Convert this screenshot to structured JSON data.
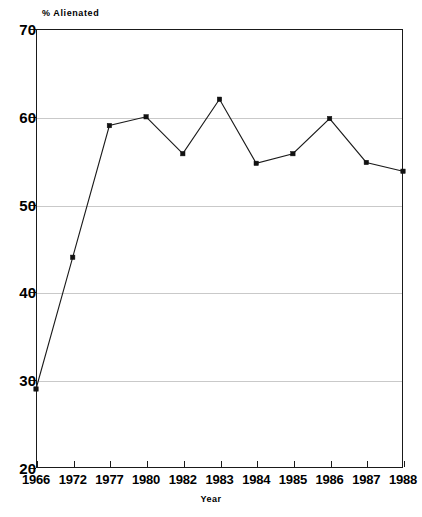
{
  "chart_data": {
    "type": "line",
    "title": "",
    "xlabel": "Year",
    "ylabel": "% Alienated",
    "categories": [
      "1966",
      "1972",
      "1977",
      "1980",
      "1982",
      "1983",
      "1984",
      "1985",
      "1986",
      "1987",
      "1988"
    ],
    "values": [
      29,
      44,
      59,
      60,
      55.8,
      62,
      54.7,
      55.8,
      59.8,
      54.8,
      53.8
    ],
    "series": [
      {
        "name": "% Alienated",
        "values": [
          29,
          44,
          59,
          60,
          55.8,
          62,
          54.7,
          55.8,
          59.8,
          54.8,
          53.8
        ]
      }
    ],
    "ylim": [
      20,
      70
    ],
    "yticks": [
      20,
      30,
      40,
      50,
      60,
      70
    ],
    "ytick_labels": [
      "20",
      "30",
      "40",
      "50",
      "60",
      "70"
    ],
    "grid": true,
    "gridlines_at": [
      30,
      40,
      50,
      60
    ],
    "legend": "none",
    "marker": "square",
    "line_color": "#1a1a1a",
    "marker_color": "#111111",
    "grid_color": "#c9c9c9"
  },
  "axes": {
    "y_caption": "% Alienated",
    "x_caption": "Year"
  }
}
